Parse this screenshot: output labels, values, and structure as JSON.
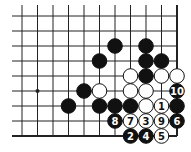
{
  "diagram": {
    "type": "go-board-fragment",
    "columns": 11,
    "rows": 9,
    "origin_x": 22,
    "origin_y": 16,
    "spacing_x": 15.5,
    "spacing_y": 15,
    "right_edge": true,
    "bottom_edge": true,
    "colors": {
      "black": "#111111",
      "white": "#ffffff",
      "line": "#222222"
    },
    "hoshi": [
      {
        "col": 1,
        "row": 5
      }
    ],
    "stones": [
      {
        "col": 6,
        "row": 2,
        "color": "black",
        "label": ""
      },
      {
        "col": 8,
        "row": 2,
        "color": "black",
        "label": ""
      },
      {
        "col": 5,
        "row": 3,
        "color": "black",
        "label": ""
      },
      {
        "col": 8,
        "row": 3,
        "color": "black",
        "label": ""
      },
      {
        "col": 9,
        "row": 3,
        "color": "black",
        "label": ""
      },
      {
        "col": 7,
        "row": 4,
        "color": "white",
        "label": ""
      },
      {
        "col": 8,
        "row": 4,
        "color": "black",
        "label": ""
      },
      {
        "col": 9,
        "row": 4,
        "color": "white",
        "label": ""
      },
      {
        "col": 10,
        "row": 4,
        "color": "white",
        "label": ""
      },
      {
        "col": 4,
        "row": 5,
        "color": "black",
        "label": ""
      },
      {
        "col": 5,
        "row": 5,
        "color": "white",
        "label": ""
      },
      {
        "col": 7,
        "row": 5,
        "color": "white",
        "label": ""
      },
      {
        "col": 8,
        "row": 5,
        "color": "white",
        "label": ""
      },
      {
        "col": 10,
        "row": 5,
        "color": "black",
        "label": "10"
      },
      {
        "col": 3,
        "row": 6,
        "color": "black",
        "label": ""
      },
      {
        "col": 5,
        "row": 6,
        "color": "black",
        "label": ""
      },
      {
        "col": 6,
        "row": 6,
        "color": "black",
        "label": ""
      },
      {
        "col": 7,
        "row": 6,
        "color": "black",
        "label": ""
      },
      {
        "col": 8,
        "row": 6,
        "color": "white",
        "label": ""
      },
      {
        "col": 9,
        "row": 6,
        "color": "white",
        "label": "1"
      },
      {
        "col": 10,
        "row": 6,
        "color": "black",
        "label": ""
      },
      {
        "col": 6,
        "row": 7,
        "color": "black",
        "label": "8"
      },
      {
        "col": 7,
        "row": 7,
        "color": "white",
        "label": "7"
      },
      {
        "col": 8,
        "row": 7,
        "color": "white",
        "label": "3"
      },
      {
        "col": 9,
        "row": 7,
        "color": "white",
        "label": "9"
      },
      {
        "col": 10,
        "row": 7,
        "color": "black",
        "label": "6"
      },
      {
        "col": 7,
        "row": 8,
        "color": "black",
        "label": "2"
      },
      {
        "col": 8,
        "row": 8,
        "color": "black",
        "label": "4"
      },
      {
        "col": 9,
        "row": 8,
        "color": "white",
        "label": "5"
      }
    ]
  }
}
